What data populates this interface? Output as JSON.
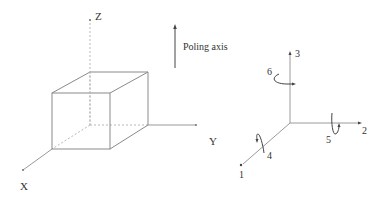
{
  "left_diagram": {
    "axis_labels": {
      "x": "X",
      "y": "Y",
      "z": "Z"
    },
    "poling_label": "Poling axis"
  },
  "right_diagram": {
    "axis_labels": {
      "axis1": "1",
      "axis2": "2",
      "axis3": "3"
    },
    "rotation_labels": {
      "r4": "4",
      "r5": "5",
      "r6": "6"
    }
  },
  "colors": {
    "line": "#8a8a8a",
    "text": "#333333",
    "background": "#ffffff"
  }
}
